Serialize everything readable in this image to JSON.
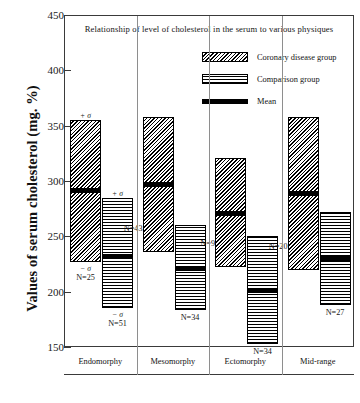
{
  "chart_data": {
    "type": "bar",
    "title": "Relationship of level of cholesterol in the serum to various physiques",
    "xlabel": "",
    "ylabel": "Values of serum cholesterol (mg. %)",
    "ylim": [
      150,
      450
    ],
    "yticks": [
      150,
      200,
      250,
      300,
      350,
      400,
      450
    ],
    "grid": false,
    "legend_position": "top-right",
    "categories": [
      "Endomorphy",
      "Mesomorphy",
      "Ectomorphy",
      "Mid-range"
    ],
    "legend": [
      {
        "key": "coronary",
        "label": "Coronary disease group",
        "pattern": "diagonal-hatch"
      },
      {
        "key": "comparison",
        "label": "Comparison group",
        "pattern": "cross-hatch"
      },
      {
        "key": "mean",
        "label": "Mean",
        "pattern": "solid-black-line"
      }
    ],
    "annotation_plus_sigma": "+ σ",
    "annotation_minus_sigma": "− σ",
    "series": [
      {
        "name": "Coronary disease group",
        "bars": [
          {
            "category": "Endomorphy",
            "plus_sigma": 355,
            "mean": 291,
            "minus_sigma": 227,
            "n_label": "N=25",
            "n": 25
          },
          {
            "category": "Mesomorphy",
            "plus_sigma": 358,
            "mean": 297,
            "minus_sigma": 236,
            "n_label": "N=43",
            "n": 43
          },
          {
            "category": "Ectomorphy",
            "plus_sigma": 321,
            "mean": 271,
            "minus_sigma": 222,
            "n_label": "N=9",
            "n": 9
          },
          {
            "category": "Mid-range",
            "plus_sigma": 358,
            "mean": 289,
            "minus_sigma": 220,
            "n_label": "N=20",
            "n": 20
          }
        ]
      },
      {
        "name": "Comparison group",
        "bars": [
          {
            "category": "Endomorphy",
            "plus_sigma": 285,
            "mean": 232,
            "minus_sigma": 185,
            "n_label": "N=51",
            "n": 51
          },
          {
            "category": "Mesomorphy",
            "plus_sigma": 260,
            "mean": 221,
            "minus_sigma": 183,
            "n_label": "N=34",
            "n": 34
          },
          {
            "category": "Ectomorphy",
            "plus_sigma": 250,
            "mean": 201,
            "minus_sigma": 153,
            "n_label": "N=34",
            "n": 34
          },
          {
            "category": "Mid-range",
            "plus_sigma": 272,
            "mean": 230,
            "minus_sigma": 188,
            "n_label": "N=27",
            "n": 27
          }
        ]
      }
    ]
  },
  "colors": {
    "axis": "#3a3a3a",
    "bar_outline": "#000000",
    "mean": "#000000",
    "text": "#141414",
    "background": "#ffffff"
  },
  "ytick_labels": [
    "450",
    "400",
    "350",
    "300",
    "250",
    "200",
    "150"
  ]
}
